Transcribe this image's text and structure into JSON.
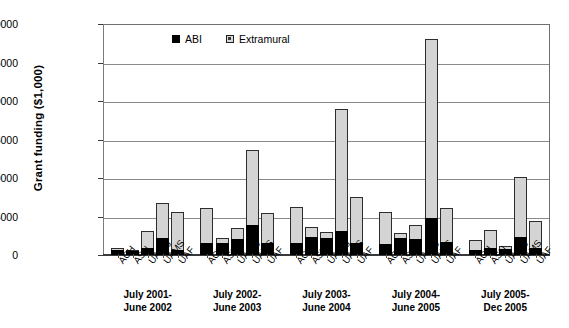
{
  "chart_data": {
    "type": "bar",
    "subtype": "stacked-grouped-vertical",
    "title": "",
    "xlabel": "",
    "ylabel": "Grant funding ($1,000)",
    "ylim": [
      0,
      30000
    ],
    "ytick_step": 5000,
    "ytick_labels": [
      "0",
      "5000",
      "10000",
      "15000",
      "20000",
      "25000",
      "30000"
    ],
    "ytick_values": [
      0,
      5000,
      10000,
      15000,
      20000,
      25000,
      30000
    ],
    "grid": true,
    "grid_axis": "y",
    "legend": {
      "position": "top-left-inside",
      "entries": [
        {
          "name": "ABI",
          "color": "#000000",
          "marker": "filled-square"
        },
        {
          "name": "Extramural",
          "color": "#d4d4d4",
          "marker": "open-square"
        }
      ]
    },
    "categories": [
      "ACH",
      "ASU",
      "UA-Ag",
      "UAMS",
      "UAF"
    ],
    "groups": [
      {
        "label_line1": "July 2001-",
        "label_line2": "June 2002",
        "bars": [
          {
            "category": "ACH",
            "abi": 600,
            "extramural": 300,
            "total": 900
          },
          {
            "category": "ASU",
            "abi": 650,
            "extramural": 50,
            "total": 700
          },
          {
            "category": "UA-Ag",
            "abi": 900,
            "extramural": 2200,
            "total": 3100
          },
          {
            "category": "UAMS",
            "abi": 2250,
            "extramural": 4450,
            "total": 6700
          },
          {
            "category": "UAF",
            "abi": 600,
            "extramural": 5000,
            "total": 5600
          }
        ]
      },
      {
        "label_line1": "July 2002-",
        "label_line2": "June 2003",
        "bars": [
          {
            "category": "ACH",
            "abi": 1550,
            "extramural": 4600,
            "total": 6150
          },
          {
            "category": "ASU",
            "abi": 1600,
            "extramural": 600,
            "total": 2200
          },
          {
            "category": "UA-Ag",
            "abi": 2100,
            "extramural": 1350,
            "total": 3450
          },
          {
            "category": "UAMS",
            "abi": 3900,
            "extramural": 9750,
            "total": 13650
          },
          {
            "category": "UAF",
            "abi": 1550,
            "extramural": 3950,
            "total": 5500
          }
        ]
      },
      {
        "label_line1": "July 2003-",
        "label_line2": "June 2004",
        "bars": [
          {
            "category": "ACH",
            "abi": 1500,
            "extramural": 4700,
            "total": 6200
          },
          {
            "category": "ASU",
            "abi": 2400,
            "extramural": 1200,
            "total": 3600
          },
          {
            "category": "UA-Ag",
            "abi": 2200,
            "extramural": 750,
            "total": 2950
          },
          {
            "category": "UAMS",
            "abi": 3100,
            "extramural": 15900,
            "total": 19000
          },
          {
            "category": "UAF",
            "abi": 1500,
            "extramural": 6000,
            "total": 7500
          }
        ]
      },
      {
        "label_line1": "July 2004-",
        "label_line2": "June 2005",
        "bars": [
          {
            "category": "ACH",
            "abi": 1450,
            "extramural": 4200,
            "total": 5650
          },
          {
            "category": "ASU",
            "abi": 2250,
            "extramural": 550,
            "total": 2800
          },
          {
            "category": "UA-Ag",
            "abi": 2100,
            "extramural": 1750,
            "total": 3850
          },
          {
            "category": "UAMS",
            "abi": 4850,
            "extramural": 23250,
            "total": 28100
          },
          {
            "category": "UAF",
            "abi": 1650,
            "extramural": 4450,
            "total": 6100
          }
        ]
      },
      {
        "label_line1": "July 2005-",
        "label_line2": "Dec 2005",
        "bars": [
          {
            "category": "ACH",
            "abi": 700,
            "extramural": 1200,
            "total": 1900
          },
          {
            "category": "ASU",
            "abi": 900,
            "extramural": 2350,
            "total": 3250
          },
          {
            "category": "UA-Ag",
            "abi": 750,
            "extramural": 400,
            "total": 1150
          },
          {
            "category": "UAMS",
            "abi": 2350,
            "extramural": 7800,
            "total": 10150
          },
          {
            "category": "UAF",
            "abi": 850,
            "extramural": 3600,
            "total": 4450
          }
        ]
      }
    ]
  }
}
